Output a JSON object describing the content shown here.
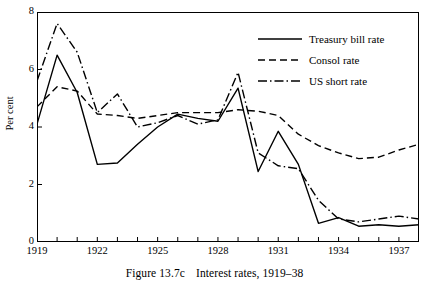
{
  "caption": {
    "figure_number": "Figure 13.7c",
    "title": "Interest rates, 1919–38"
  },
  "axes": {
    "y_title": "Per cent",
    "y_ticks": [
      "0",
      "2",
      "4",
      "6",
      "8"
    ],
    "x_ticks_labeled": [
      "1919",
      "1922",
      "1925",
      "1928",
      "1931",
      "1934",
      "1937"
    ]
  },
  "legend": {
    "items": [
      {
        "label": "Treasury bill rate",
        "style": "solid"
      },
      {
        "label": "Consol rate",
        "style": "dashed"
      },
      {
        "label": "US short rate",
        "style": "dashdot"
      }
    ]
  },
  "chart_data": {
    "type": "line",
    "title": "Interest rates, 1919–38",
    "xlabel": "",
    "ylabel": "Per cent",
    "xlim": [
      1919,
      1938
    ],
    "ylim": [
      0,
      8
    ],
    "ytick_values": [
      0,
      2,
      4,
      6,
      8
    ],
    "xtick_values": [
      1919,
      1920,
      1921,
      1922,
      1923,
      1924,
      1925,
      1926,
      1927,
      1928,
      1929,
      1930,
      1931,
      1932,
      1933,
      1934,
      1935,
      1936,
      1937,
      1938
    ],
    "xtick_labels_shown": [
      1919,
      1922,
      1925,
      1928,
      1931,
      1934,
      1937
    ],
    "grid": false,
    "legend_position": "upper right",
    "x": [
      1919,
      1920,
      1921,
      1922,
      1923,
      1924,
      1925,
      1926,
      1927,
      1928,
      1929,
      1930,
      1931,
      1932,
      1933,
      1934,
      1935,
      1936,
      1937,
      1938
    ],
    "series": [
      {
        "name": "Treasury bill rate",
        "style": "solid",
        "color": "#000000",
        "values": [
          4.1,
          6.5,
          5.2,
          2.7,
          2.75,
          3.4,
          4.0,
          4.45,
          4.3,
          4.2,
          5.35,
          2.45,
          3.85,
          2.7,
          0.65,
          0.85,
          0.55,
          0.6,
          0.55,
          0.6
        ]
      },
      {
        "name": "Consol rate",
        "style": "dashed",
        "color": "#000000",
        "values": [
          4.7,
          5.4,
          5.25,
          4.45,
          4.4,
          4.3,
          4.4,
          4.5,
          4.5,
          4.5,
          4.6,
          4.55,
          4.4,
          3.75,
          3.35,
          3.1,
          2.9,
          2.95,
          3.2,
          3.4
        ]
      },
      {
        "name": "US short rate",
        "style": "dashdot",
        "color": "#000000",
        "values": [
          5.6,
          7.6,
          6.6,
          4.5,
          5.15,
          4.0,
          4.15,
          4.4,
          4.1,
          4.25,
          5.9,
          3.1,
          2.65,
          2.55,
          1.45,
          0.8,
          0.7,
          0.8,
          0.9,
          0.8
        ]
      }
    ]
  }
}
